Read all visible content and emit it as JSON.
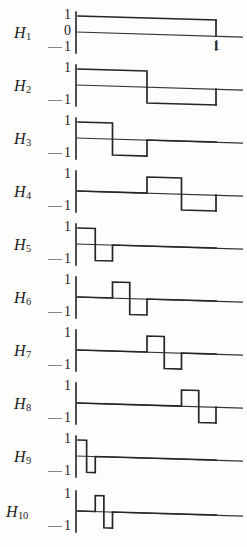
{
  "figure": {
    "title": "",
    "line_color": "#262626",
    "axis_color": "#222222",
    "background": "#fdfdfb"
  },
  "axis_labels": {
    "one": "1",
    "zero": "0",
    "minus": "—",
    "minus_one_prefix": "—",
    "minus_one_value": "1",
    "x_end": "1"
  },
  "rows": [
    {
      "label": "H",
      "index": "1",
      "name": "H1",
      "top_tick": "1",
      "mid_tick": "0",
      "bottom_tick": "1",
      "has_mid_tick": true,
      "x_tick": "1",
      "segments": [
        {
          "x0": 0.0,
          "x1": 1.0,
          "y": 1
        }
      ]
    },
    {
      "label": "H",
      "index": "2",
      "name": "H2",
      "top_tick": "1",
      "mid_tick": "",
      "bottom_tick": "1",
      "has_mid_tick": false,
      "x_tick": "",
      "segments": [
        {
          "x0": 0.0,
          "x1": 0.5,
          "y": 1
        },
        {
          "x0": 0.5,
          "x1": 1.0,
          "y": -1
        }
      ]
    },
    {
      "label": "H",
      "index": "3",
      "name": "H3",
      "top_tick": "1",
      "mid_tick": "",
      "bottom_tick": "1",
      "has_mid_tick": false,
      "x_tick": "",
      "segments": [
        {
          "x0": 0.0,
          "x1": 0.25,
          "y": 1
        },
        {
          "x0": 0.25,
          "x1": 0.5,
          "y": -1
        },
        {
          "x0": 0.5,
          "x1": 1.0,
          "y": 0
        }
      ]
    },
    {
      "label": "H",
      "index": "4",
      "name": "H4",
      "top_tick": "1",
      "mid_tick": "",
      "bottom_tick": "1",
      "has_mid_tick": false,
      "x_tick": "",
      "segments": [
        {
          "x0": 0.0,
          "x1": 0.5,
          "y": 0
        },
        {
          "x0": 0.5,
          "x1": 0.75,
          "y": 1
        },
        {
          "x0": 0.75,
          "x1": 1.0,
          "y": -1
        }
      ]
    },
    {
      "label": "H",
      "index": "5",
      "name": "H5",
      "top_tick": "1",
      "mid_tick": "",
      "bottom_tick": "1",
      "has_mid_tick": false,
      "x_tick": "",
      "segments": [
        {
          "x0": 0.0,
          "x1": 0.125,
          "y": 1
        },
        {
          "x0": 0.125,
          "x1": 0.25,
          "y": -1
        },
        {
          "x0": 0.25,
          "x1": 1.0,
          "y": 0
        }
      ]
    },
    {
      "label": "H",
      "index": "6",
      "name": "H6",
      "top_tick": "1",
      "mid_tick": "",
      "bottom_tick": "1",
      "has_mid_tick": false,
      "x_tick": "",
      "segments": [
        {
          "x0": 0.0,
          "x1": 0.25,
          "y": 0
        },
        {
          "x0": 0.25,
          "x1": 0.375,
          "y": 1
        },
        {
          "x0": 0.375,
          "x1": 0.5,
          "y": -1
        },
        {
          "x0": 0.5,
          "x1": 1.0,
          "y": 0
        }
      ]
    },
    {
      "label": "H",
      "index": "7",
      "name": "H7",
      "top_tick": "1",
      "mid_tick": "",
      "bottom_tick": "1",
      "has_mid_tick": false,
      "x_tick": "",
      "segments": [
        {
          "x0": 0.0,
          "x1": 0.5,
          "y": 0
        },
        {
          "x0": 0.5,
          "x1": 0.625,
          "y": 1
        },
        {
          "x0": 0.625,
          "x1": 0.75,
          "y": -1
        },
        {
          "x0": 0.75,
          "x1": 1.0,
          "y": 0
        }
      ]
    },
    {
      "label": "H",
      "index": "8",
      "name": "H8",
      "top_tick": "1",
      "mid_tick": "",
      "bottom_tick": "1",
      "has_mid_tick": false,
      "x_tick": "",
      "segments": [
        {
          "x0": 0.0,
          "x1": 0.75,
          "y": 0
        },
        {
          "x0": 0.75,
          "x1": 0.875,
          "y": 1
        },
        {
          "x0": 0.875,
          "x1": 1.0,
          "y": -1
        }
      ]
    },
    {
      "label": "H",
      "index": "9",
      "name": "H9",
      "top_tick": "1",
      "mid_tick": "",
      "bottom_tick": "1",
      "has_mid_tick": false,
      "x_tick": "",
      "segments": [
        {
          "x0": 0.0,
          "x1": 0.0625,
          "y": 1
        },
        {
          "x0": 0.0625,
          "x1": 0.125,
          "y": -1
        },
        {
          "x0": 0.125,
          "x1": 1.0,
          "y": 0
        }
      ]
    },
    {
      "label": "H",
      "index": "10",
      "name": "H10",
      "top_tick": "1",
      "mid_tick": "",
      "bottom_tick": "1",
      "has_mid_tick": false,
      "x_tick": "",
      "segments": [
        {
          "x0": 0.0,
          "x1": 0.125,
          "y": 0
        },
        {
          "x0": 0.125,
          "x1": 0.1875,
          "y": 1
        },
        {
          "x0": 0.1875,
          "x1": 0.25,
          "y": -1
        },
        {
          "x0": 0.25,
          "x1": 1.0,
          "y": 0
        }
      ]
    }
  ],
  "chart_data": {
    "type": "line",
    "xlabel": "",
    "ylabel": "",
    "xlim": [
      0,
      1
    ],
    "ylim": [
      -1,
      1
    ],
    "grid": false,
    "legend": "none",
    "xticks": [
      0,
      1
    ],
    "xticklabels": [
      "",
      "1"
    ],
    "yticks": [
      -1,
      0,
      1
    ],
    "yticklabels": [
      "—1",
      "0",
      "1"
    ],
    "series": [
      {
        "name": "H1",
        "type": "step",
        "breakpoints": [
          0,
          1
        ],
        "values": [
          1
        ]
      },
      {
        "name": "H2",
        "type": "step",
        "breakpoints": [
          0,
          0.5,
          1
        ],
        "values": [
          1,
          -1
        ]
      },
      {
        "name": "H3",
        "type": "step",
        "breakpoints": [
          0,
          0.25,
          0.5,
          1
        ],
        "values": [
          1,
          -1,
          0
        ]
      },
      {
        "name": "H4",
        "type": "step",
        "breakpoints": [
          0,
          0.5,
          0.75,
          1
        ],
        "values": [
          0,
          1,
          -1
        ]
      },
      {
        "name": "H5",
        "type": "step",
        "breakpoints": [
          0,
          0.125,
          0.25,
          1
        ],
        "values": [
          1,
          -1,
          0
        ]
      },
      {
        "name": "H6",
        "type": "step",
        "breakpoints": [
          0,
          0.25,
          0.375,
          0.5,
          1
        ],
        "values": [
          0,
          1,
          -1,
          0
        ]
      },
      {
        "name": "H7",
        "type": "step",
        "breakpoints": [
          0,
          0.5,
          0.625,
          0.75,
          1
        ],
        "values": [
          0,
          1,
          -1,
          0
        ]
      },
      {
        "name": "H8",
        "type": "step",
        "breakpoints": [
          0,
          0.75,
          0.875,
          1
        ],
        "values": [
          0,
          1,
          -1
        ]
      },
      {
        "name": "H9",
        "type": "step",
        "breakpoints": [
          0,
          0.0625,
          0.125,
          1
        ],
        "values": [
          1,
          -1,
          0
        ]
      },
      {
        "name": "H10",
        "type": "step",
        "breakpoints": [
          0,
          0.125,
          0.1875,
          0.25,
          1
        ],
        "values": [
          0,
          1,
          -1,
          0
        ]
      }
    ]
  }
}
